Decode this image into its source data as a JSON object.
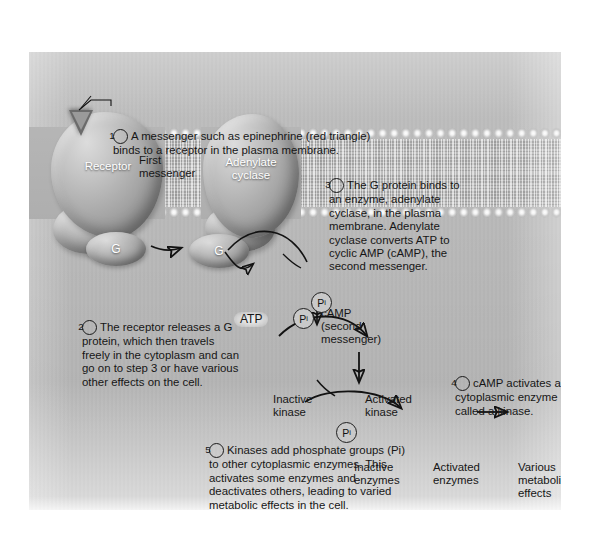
{
  "figure": {
    "background_color": "#ffffff",
    "plate_color": "#b9b9b9",
    "ink_color": "#161616"
  },
  "steps": [
    {
      "number": "1",
      "text": "A messenger such as epinephrine (red triangle) binds to a receptor in the plasma membrane."
    },
    {
      "number": "2",
      "text": "The receptor releases a G protein, which then travels freely in the cytoplasm and can go on to step 3 or have various other effects on the cell."
    },
    {
      "number": "3",
      "text": "The G protein binds to an enzyme, adenylate cyclase, in the plasma membrane. Adenylate cyclase converts ATP to cyclic AMP (cAMP), the second messenger."
    },
    {
      "number": "4",
      "text": "cAMP activates a cytoplasmic enzyme called a kinase."
    },
    {
      "number": "5",
      "text": "Kinases add phosphate groups (Pi) to other cytoplasmic enzymes. This activates some enzymes and deactivates others, leading to varied metabolic effects in the cell."
    }
  ],
  "labels": {
    "first_messenger": "First\nmessenger",
    "receptor": "Receptor",
    "adenylate_cyclase": "Adenylate\ncyclase",
    "g_protein": "G",
    "atp": "ATP",
    "camp": "cAMP\n(second\nmessenger)",
    "inactive_kinase": "Inactive\nkinase",
    "activated_kinase": "Activated\nkinase",
    "inactive_enzymes": "Inactive\nenzymes",
    "activated_enzymes": "Activated\nenzymes",
    "various_metabolic_effects": "Various\nmetabolic\neffects",
    "phosphate": "P",
    "phosphate_subscript": "i"
  }
}
